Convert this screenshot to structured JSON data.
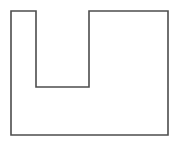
{
  "canvas": {
    "width": 178,
    "height": 141,
    "background_color": "#ffffff"
  },
  "figure": {
    "name": "notched-rectangle",
    "stroke_color": "#4d4d4d",
    "fill_color": "#ffffff",
    "stroke_width": 1.6,
    "vertices": [
      {
        "x": 11,
        "y": 11
      },
      {
        "x": 36,
        "y": 11
      },
      {
        "x": 36,
        "y": 87
      },
      {
        "x": 89,
        "y": 87
      },
      {
        "x": 89,
        "y": 11
      },
      {
        "x": 168,
        "y": 11
      },
      {
        "x": 168,
        "y": 135
      },
      {
        "x": 11,
        "y": 135
      }
    ],
    "points_attr": "11,11 36,11 36,87 89,87 89,11 168,11 168,135 11,135",
    "bounds": {
      "left": 11,
      "top": 11,
      "right": 168,
      "bottom": 135,
      "width": 157,
      "height": 124
    },
    "notch": {
      "left": 36,
      "right": 89,
      "top": 11,
      "bottom": 87,
      "width": 53,
      "depth": 76
    },
    "left_prong": {
      "left": 11,
      "right": 36,
      "width": 25
    },
    "right_prong": {
      "left": 89,
      "right": 168,
      "width": 79
    },
    "edge_count": 8,
    "vertex_count": 8
  }
}
